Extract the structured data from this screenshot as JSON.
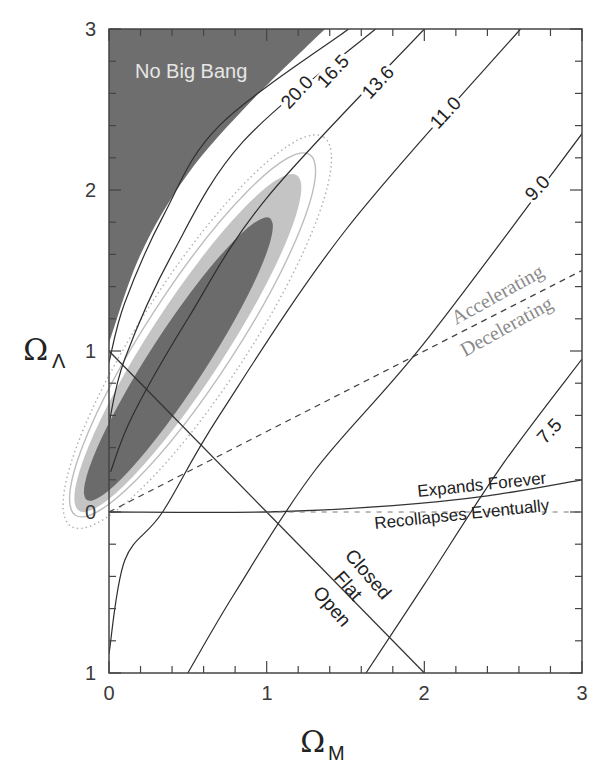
{
  "chart_data": {
    "type": "line",
    "title": "",
    "xlabel": "Ω_M",
    "ylabel": "Ω_Λ",
    "xlabel_main": "Ω",
    "xlabel_sub": "M",
    "ylabel_main": "Ω",
    "ylabel_sub": "Λ",
    "xlim": [
      0,
      3
    ],
    "ylim": [
      -1,
      3
    ],
    "x_ticks": [
      "0",
      "1",
      "2",
      "3"
    ],
    "y_ticks": [
      "1",
      "0",
      "1",
      "2",
      "3"
    ],
    "y_tick_values": [
      -1,
      0,
      1,
      2,
      3
    ],
    "grid": false,
    "regions": [
      {
        "name": "No Big Bang",
        "label": "No Big Bang",
        "color": "#6e6e6e",
        "boundary": [
          [
            0,
            1.05
          ],
          [
            0.2,
            1.6
          ],
          [
            0.5,
            2.1
          ],
          [
            0.9,
            2.55
          ],
          [
            1.37,
            3.0
          ]
        ]
      }
    ],
    "age_contours_gyr": [
      {
        "label": "20.0",
        "points": [
          [
            0,
            0.93
          ],
          [
            0.1,
            1.3
          ],
          [
            0.35,
            1.85
          ],
          [
            0.7,
            2.4
          ],
          [
            1.52,
            3.0
          ]
        ]
      },
      {
        "label": "16.5",
        "points": [
          [
            0,
            0.55
          ],
          [
            0.1,
            0.95
          ],
          [
            0.4,
            1.6
          ],
          [
            0.85,
            2.3
          ],
          [
            1.69,
            3.0
          ]
        ]
      },
      {
        "label": "13.6",
        "points": [
          [
            0.01,
            0.25
          ],
          [
            0.15,
            0.6
          ],
          [
            0.5,
            1.2
          ],
          [
            1.0,
            1.95
          ],
          [
            2.0,
            3.0
          ]
        ]
      },
      {
        "label": "11.0",
        "points": [
          [
            0,
            -0.88
          ],
          [
            0.1,
            -0.3
          ],
          [
            0.34,
            0.0
          ],
          [
            0.7,
            0.6
          ],
          [
            1.5,
            1.75
          ],
          [
            2.61,
            3.0
          ]
        ]
      },
      {
        "label": "9.0",
        "points": [
          [
            0.5,
            -1.0
          ],
          [
            0.8,
            -0.5
          ],
          [
            1.3,
            0.25
          ],
          [
            2.0,
            1.05
          ],
          [
            3.0,
            2.35
          ]
        ]
      },
      {
        "label": "7.5",
        "points": [
          [
            1.63,
            -1.0
          ],
          [
            2.0,
            -0.45
          ],
          [
            2.5,
            0.3
          ],
          [
            3.0,
            0.95
          ]
        ]
      }
    ],
    "reference_lines": [
      {
        "name": "Flat (Ω_M + Ω_Λ = 1)",
        "points": [
          [
            0,
            1
          ],
          [
            2,
            -1
          ]
        ],
        "style": "solid"
      },
      {
        "name": "Accelerating/Decelerating (Ω_Λ = Ω_M/2)",
        "points": [
          [
            0,
            0
          ],
          [
            3,
            1.5
          ]
        ],
        "style": "dashed"
      },
      {
        "name": "Expands Forever / Recollapses Eventually",
        "points": [
          [
            0,
            0
          ],
          [
            1.0,
            0.0
          ],
          [
            1.8,
            0.04
          ],
          [
            2.4,
            0.1
          ],
          [
            3.0,
            0.2
          ]
        ],
        "style": "solid"
      },
      {
        "name": "Ω_Λ = 0",
        "points": [
          [
            1.0,
            0.0
          ],
          [
            3.0,
            0.0
          ]
        ],
        "style": "dashed-faint"
      }
    ],
    "confidence_contours": [
      {
        "level": "68%",
        "fill": "#6b6b6b",
        "center": [
          0.44,
          0.95
        ],
        "rx_px": 168,
        "ry_px": 28,
        "angle_deg": -57
      },
      {
        "level": "95%",
        "fill": "#c4c4c4",
        "center": [
          0.5,
          1.05
        ],
        "rx_px": 200,
        "ry_px": 38,
        "angle_deg": -57
      },
      {
        "level": "outline",
        "stroke": "#bdbdbd",
        "center": [
          0.53,
          1.1
        ],
        "rx_px": 215,
        "ry_px": 45,
        "angle_deg": -57
      },
      {
        "level": "dotted",
        "stroke": "#b0b0b0",
        "center": [
          0.56,
          1.12
        ],
        "rx_px": 232,
        "ry_px": 54,
        "angle_deg": -57
      }
    ],
    "annotations": [
      "No Big Bang",
      "20.0",
      "16.5",
      "13.6",
      "11.0",
      "9.0",
      "7.5",
      "Accelerating",
      "Decelerating",
      "Expands Forever",
      "Recollapses Eventually",
      "Closed",
      "Flat",
      "Open"
    ]
  },
  "labels": {
    "no_big_bang": "No Big Bang",
    "c20": "20.0",
    "c165": "16.5",
    "c136": "13.6",
    "c110": "11.0",
    "c90": "9.0",
    "c75": "7.5",
    "accelerating": "Accelerating",
    "decelerating": "Decelerating",
    "expands": "Expands Forever",
    "recollapses": "Recollapses Eventually",
    "closed": "Closed",
    "flat": "Flat",
    "open": "Open"
  },
  "colors": {
    "dark_region": "#6e6e6e",
    "sigma1": "#6b6b6b",
    "sigma2": "#c4c4c4",
    "axis": "#444444",
    "line": "#333333",
    "muted_text": "#8a8a8a"
  }
}
